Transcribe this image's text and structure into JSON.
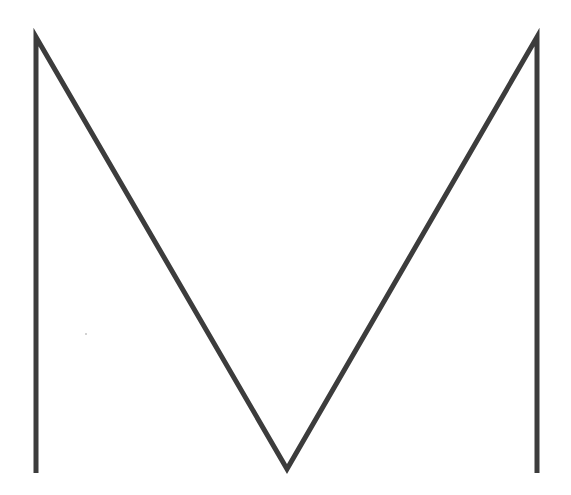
{
  "figure": {
    "letter": "M",
    "background": "#ffffff",
    "stroke_color": "#3c3c3c",
    "stroke_width": 5,
    "points": {
      "left_bottom": [
        36,
        473
      ],
      "left_top": [
        36,
        37
      ],
      "valley": [
        287,
        469
      ],
      "right_top": [
        537,
        37
      ],
      "right_bottom": [
        537,
        473
      ]
    },
    "dot": [
      86,
      334
    ]
  }
}
